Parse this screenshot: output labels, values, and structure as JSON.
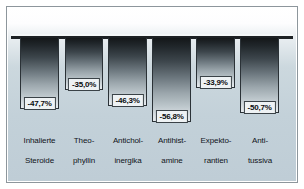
{
  "chart_data": {
    "type": "bar",
    "title": "",
    "subtitle": "",
    "xlabel": "",
    "ylabel": "",
    "orientation": "vertical-downward",
    "grid": false,
    "legend": null,
    "ylim": [
      -60,
      0
    ],
    "baseline": 0,
    "value_suffix": "%",
    "decimal_separator": ",",
    "categories": [
      "Inhalierte\nSteroide",
      "Theo-\nphyllin",
      "Anticholi-\ninergika",
      "Antihist-\namine",
      "Expekto-\nrantien",
      "Anti-\ntussiva"
    ],
    "values": [
      -47.7,
      -35.0,
      -46.3,
      -56.8,
      -33.9,
      -50.7
    ],
    "value_labels": [
      "-47,7%",
      "-35,0%",
      "-46,3%",
      "-56,8%",
      "-33,9%",
      "-50,7%"
    ],
    "colors": {
      "bar_top": "#141719",
      "bar_bottom": "#e6ebee",
      "bar_outline": "#2b3237",
      "axis_line": "#1d2124",
      "plot_background_top": "#ffffff",
      "plot_background_bottom": "#bfcdd6",
      "frame_border": "#8d969c",
      "badge_fill": "#eef2f4",
      "label_text": "#10141a"
    }
  },
  "bars": [
    {
      "category": "Inhalierte Steroide",
      "line1": "Inhalierte",
      "line2": "Steroide",
      "value_label": "-47,7%",
      "value": -47.7
    },
    {
      "category": "Theophyllin",
      "line1": "Theo-",
      "line2": "phyllin",
      "value_label": "-35,0%",
      "value": -35.0
    },
    {
      "category": "Anticholinergika",
      "line1": "Antichol-",
      "line2": "inergika",
      "value_label": "-46,3%",
      "value": -46.3
    },
    {
      "category": "Antihistamine",
      "line1": "Antihist-",
      "line2": "amine",
      "value_label": "-56,8%",
      "value": -56.8
    },
    {
      "category": "Expektorantien",
      "line1": "Expekto-",
      "line2": "rantien",
      "value_label": "-33,9%",
      "value": -33.9
    },
    {
      "category": "Antitussiva",
      "line1": "Anti-",
      "line2": "tussiva",
      "value_label": "-50,7%",
      "value": -50.7
    }
  ]
}
